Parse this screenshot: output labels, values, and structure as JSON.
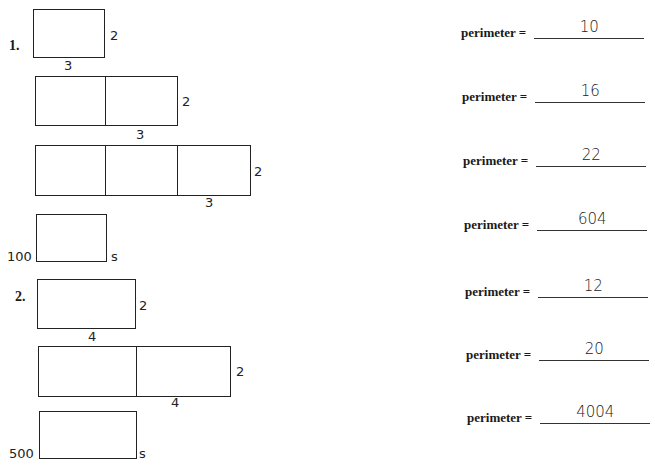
{
  "problems": [
    {
      "number": "1.",
      "figures": [
        {
          "side_label": "2",
          "bottom_label": "3",
          "cells": 1,
          "perimeter": "10"
        },
        {
          "side_label": "2",
          "bottom_label": "3",
          "cells": 2,
          "perimeter": "16"
        },
        {
          "side_label": "2",
          "bottom_label": "3",
          "cells": 3,
          "perimeter": "22"
        },
        {
          "left_label": "100",
          "side_label": "s",
          "cells": 1,
          "perimeter": "604"
        }
      ]
    },
    {
      "number": "2.",
      "figures": [
        {
          "side_label": "2",
          "bottom_label": "4",
          "cells": 1,
          "perimeter": "12"
        },
        {
          "side_label": "2",
          "bottom_label": "4",
          "cells": 2,
          "perimeter": "20"
        },
        {
          "left_label": "500",
          "side_label": "s",
          "cells": 1,
          "perimeter": "4004"
        }
      ]
    }
  ],
  "perimeter_label": "perimeter ="
}
